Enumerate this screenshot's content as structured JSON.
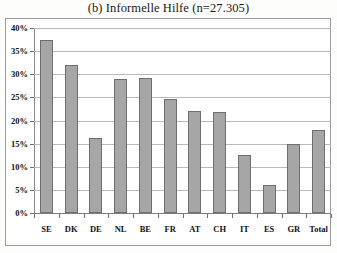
{
  "chart_data": {
    "type": "bar",
    "title": "(b) Informelle Hilfe (n=27.305)",
    "xlabel": "",
    "ylabel": "",
    "ylim": [
      0,
      40
    ],
    "ytick_step": 5,
    "ytick_labels": [
      "0%",
      "5%",
      "10%",
      "15%",
      "20%",
      "25%",
      "30%",
      "35%",
      "40%"
    ],
    "ytick_values": [
      0,
      5,
      10,
      15,
      20,
      25,
      30,
      35,
      40
    ],
    "grid": true,
    "legend": "none",
    "bar_color": "#a6a6a6",
    "bar_border_color": "#6e6e6e",
    "categories": [
      "SE",
      "DK",
      "DE",
      "NL",
      "BE",
      "FR",
      "AT",
      "CH",
      "IT",
      "ES",
      "GR",
      "Total"
    ],
    "values": [
      37.5,
      32.0,
      16.2,
      28.9,
      29.2,
      24.6,
      22.0,
      21.8,
      12.5,
      6.0,
      15.0,
      17.9
    ]
  }
}
